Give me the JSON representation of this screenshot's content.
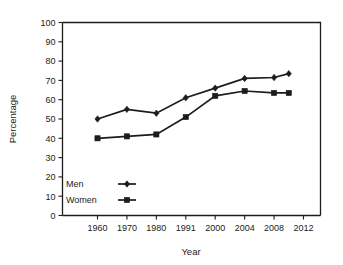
{
  "chart_data": {
    "type": "line",
    "title": "",
    "xlabel": "Year",
    "ylabel": "Percentage",
    "x": [
      "1960",
      "1970",
      "1980",
      "1991",
      "2000",
      "2004",
      "2008",
      "2010"
    ],
    "xtick_labels": [
      "1960",
      "1970",
      "1980",
      "1991",
      "2000",
      "2004",
      "2008",
      "2012"
    ],
    "ytick_labels": [
      "0",
      "10",
      "20",
      "30",
      "40",
      "50",
      "60",
      "70",
      "80",
      "90",
      "100"
    ],
    "ylim": [
      0,
      100
    ],
    "grid": false,
    "legend_position": "bottom-left",
    "series": [
      {
        "name": "Men",
        "marker": "diamond",
        "values": [
          50,
          55,
          53,
          61,
          66,
          71,
          71.5,
          73.5
        ]
      },
      {
        "name": "Women",
        "marker": "square",
        "values": [
          40,
          41,
          42,
          51,
          62,
          64.5,
          63.5,
          63.5
        ]
      }
    ]
  },
  "legend": {
    "items": [
      {
        "label": "Men",
        "marker": "diamond"
      },
      {
        "label": "Women",
        "marker": "square"
      }
    ]
  },
  "axes": {
    "y_title": "Percentage",
    "x_title": "Year"
  }
}
